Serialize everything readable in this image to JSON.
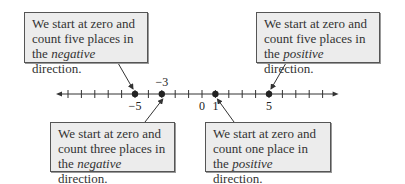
{
  "number_line": {
    "min_tick": -10,
    "max_tick": 9,
    "labels": [
      {
        "value": -5,
        "text": "−5",
        "position": "below"
      },
      {
        "value": -3,
        "text": "−3",
        "position": "above"
      },
      {
        "value": 0,
        "text": "0",
        "position": "below"
      },
      {
        "value": 1,
        "text": "1",
        "position": "below"
      },
      {
        "value": 5,
        "text": "5",
        "position": "below"
      }
    ],
    "points": [
      -5,
      -3,
      1,
      5
    ]
  },
  "callouts": [
    {
      "id": "neg5",
      "line1": "We start at zero and",
      "line2": "count five places in",
      "line3_pre": "the ",
      "line3_em": "negative",
      "line3_post": " direction.",
      "target": -5
    },
    {
      "id": "pos5",
      "line1": "We start at zero and",
      "line2": "count five places in",
      "line3_pre": "the ",
      "line3_em": "positive",
      "line3_post": " direction.",
      "target": 5
    },
    {
      "id": "neg3",
      "line1": "We start at zero and",
      "line2": "count three places in",
      "line3_pre": "the ",
      "line3_em": "negative",
      "line3_post": " direction.",
      "target": -3
    },
    {
      "id": "pos1",
      "line1": "We start at zero and",
      "line2": "count one place in",
      "line3_pre": "the ",
      "line3_em": "positive",
      "line3_post": " direction.",
      "target": 1
    }
  ]
}
